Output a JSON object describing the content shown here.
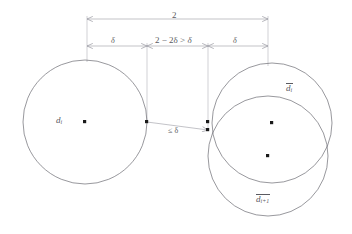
{
  "figure": {
    "labels": {
      "total_width": "2",
      "left_gap": "δ",
      "middle_gap_prefix": "2 − 2δ > ",
      "middle_gap_delta": "δ",
      "right_gap": "δ",
      "left_disk": "d",
      "left_disk_sub": "i",
      "distance": "≤ δ",
      "upper_disk": "d",
      "upper_disk_sub": "i",
      "lower_disk": "d",
      "lower_disk_sub": "i+1"
    },
    "colors": {
      "stroke": "#6b6b72",
      "guide": "#9a9aa2",
      "text": "#5a5a60",
      "point": "#1a1a1a",
      "background": "#ffffff"
    },
    "geometry": {
      "left_circle": {
        "cx": 85,
        "cy": 122,
        "r": 62
      },
      "upper_right_circle": {
        "cx": 272,
        "cy": 123,
        "r": 60
      },
      "lower_right_circle": {
        "cx": 268,
        "cy": 156,
        "r": 60
      },
      "guide_x": [
        87,
        147,
        208,
        268
      ],
      "dim_top_y": 19,
      "dim_mid_y": 46,
      "points": [
        {
          "x": 85,
          "y": 122,
          "name": "left-center"
        },
        {
          "x": 147,
          "y": 122,
          "name": "left-edge"
        },
        {
          "x": 208,
          "y": 122,
          "name": "right-upper-edge"
        },
        {
          "x": 208,
          "y": 130,
          "name": "right-lower-edge"
        },
        {
          "x": 272,
          "y": 123,
          "name": "upper-center"
        },
        {
          "x": 268,
          "y": 156,
          "name": "lower-center"
        }
      ]
    }
  }
}
